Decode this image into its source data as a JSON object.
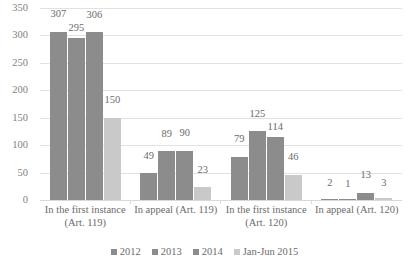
{
  "chart_data": {
    "type": "bar",
    "title": "",
    "subtitle": "",
    "xlabel": "",
    "ylabel": "",
    "ylim": [
      0,
      350
    ],
    "ytick_step": 50,
    "yticks": [
      350,
      300,
      250,
      200,
      150,
      100,
      50,
      0
    ],
    "grid": true,
    "legend_position": "bottom",
    "categories": [
      "In the first instance (Art. 119)",
      "In appeal (Art. 119)",
      "In the first instance (Art. 120)",
      "In appeal (Art. 120)"
    ],
    "series": [
      {
        "name": "2012",
        "color": "#8c8c8c",
        "values": [
          307,
          49,
          79,
          2
        ]
      },
      {
        "name": "2013",
        "color": "#8c8c8c",
        "values": [
          295,
          89,
          125,
          1
        ]
      },
      {
        "name": "2014",
        "color": "#8c8c8c",
        "values": [
          306,
          90,
          114,
          13
        ]
      },
      {
        "name": "Jan-Jun 2015",
        "color": "#c9c9c9",
        "values": [
          150,
          23,
          46,
          3
        ]
      }
    ]
  },
  "colors": {
    "series_dark": "#8c8c8c",
    "series_light": "#c9c9c9",
    "gridline": "#e2e2e2",
    "text": "#6b6b6b",
    "axis_text": "#7f7f7f",
    "background": "#ffffff"
  }
}
